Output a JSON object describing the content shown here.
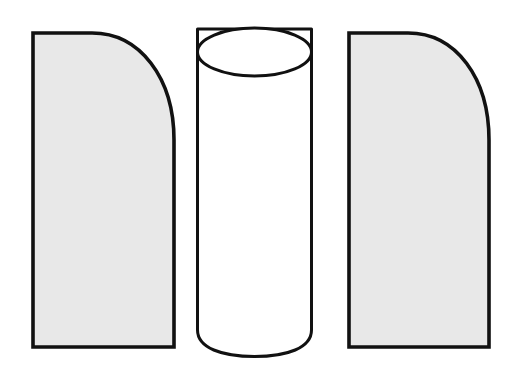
{
  "figure": {
    "caption": "des impulsi. Starren Pfeilers",
    "background_color": "#ffffff",
    "outline_color": "#111111",
    "panel_fill_color": "#e8e8e8",
    "cylinder_fill_color": "#ffffff",
    "shapes": [
      {
        "name": "left-panel",
        "label": "left shaded panel",
        "x": 31,
        "y": 31,
        "width": 145,
        "height": 318,
        "corner": "top-right",
        "corner_radius": 104,
        "fill": "#e8e8e8",
        "stroke": "#111111",
        "stroke_width": 3.5
      },
      {
        "name": "center-cylinder",
        "label": "central white cylinder",
        "x": 196,
        "y": 28,
        "width": 117,
        "height": 329,
        "cap_radius_y": 24,
        "fill": "#ffffff",
        "stroke": "#111111",
        "stroke_width": 3
      },
      {
        "name": "right-panel",
        "label": "right shaded panel",
        "x": 347,
        "y": 31,
        "width": 144,
        "height": 318,
        "corner": "top-right",
        "corner_radius": 104,
        "fill": "#e8e8e8",
        "stroke": "#111111",
        "stroke_width": 3.5
      }
    ]
  }
}
